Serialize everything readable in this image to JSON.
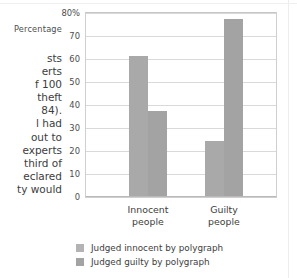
{
  "body_text": {
    "lines": [
      "sts",
      "erts",
      "f 100",
      " theft",
      "84).",
      "l had",
      "out to",
      "experts",
      "third of",
      "eclared",
      "ty would"
    ]
  },
  "chart_data": {
    "type": "bar",
    "title": "",
    "xlabel": "",
    "ylabel": "Percentage",
    "categories": [
      "Innocent\npeople",
      "Guilty\npeople"
    ],
    "category_labels": [
      {
        "line1": "Innocent",
        "line2": "people"
      },
      {
        "line1": "Guilty",
        "line2": "people"
      }
    ],
    "series": [
      {
        "name": "Judged innocent by polygraph",
        "values": [
          61,
          24
        ],
        "color": "#a9a9a9"
      },
      {
        "name": "Judged guilty by polygraph",
        "values": [
          37,
          77
        ],
        "color": "#a3a3a3"
      }
    ],
    "ylim": [
      0,
      80
    ],
    "yticks": [
      80,
      70,
      60,
      50,
      40,
      30,
      20,
      10,
      0
    ],
    "ytick_labels": [
      "80%",
      "70",
      "60",
      "50",
      "40",
      "30",
      "20",
      "10",
      "0"
    ],
    "grid": true,
    "legend_position": "bottom"
  },
  "legend": {
    "entries": [
      {
        "label": "Judged innocent by polygraph"
      },
      {
        "label": "Judged guilty by polygraph"
      }
    ]
  },
  "colors": {
    "bar_light": "#a9a9a9",
    "bar_dark": "#a3a3a3",
    "gridline": "#d9d9d9",
    "frame": "#cfcfcf",
    "text": "#3d3d3d"
  }
}
